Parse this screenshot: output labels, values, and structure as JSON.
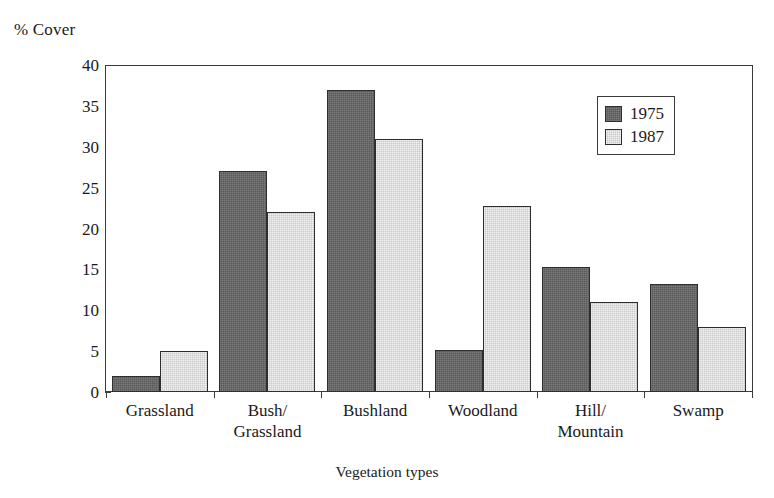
{
  "chart_data": {
    "type": "bar",
    "title": "",
    "xlabel": "Vegetation types",
    "ylabel": "% Cover",
    "ylim": [
      0,
      40
    ],
    "yticks": [
      0,
      5,
      10,
      15,
      20,
      25,
      30,
      35,
      40
    ],
    "ytick_labels": [
      "0",
      "5",
      "10",
      "15",
      "20",
      "25",
      "30",
      "35",
      "40"
    ],
    "grid": false,
    "legend_position": "top-right",
    "categories": [
      "Grassland",
      "Bush/\nGrassland",
      "Bushland",
      "Woodland",
      "Hill/\nMountain",
      "Swamp"
    ],
    "series": [
      {
        "name": "1975",
        "color": "#595959",
        "values": [
          2.0,
          27.0,
          37.0,
          5.1,
          15.3,
          13.2
        ]
      },
      {
        "name": "1987",
        "color": "#c9c9c9",
        "values": [
          5.0,
          22.0,
          31.0,
          22.7,
          11.0,
          8.0
        ]
      }
    ]
  },
  "legend": {
    "entries": [
      {
        "label": "1975",
        "swatch": "dark-gray-swatch"
      },
      {
        "label": "1987",
        "swatch": "light-gray-swatch"
      }
    ]
  }
}
